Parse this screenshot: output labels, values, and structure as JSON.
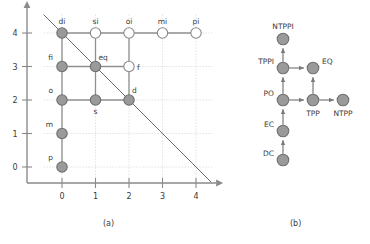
{
  "figure": {
    "captions": {
      "a": "(a)",
      "b": "(b)"
    }
  },
  "chart_data": [
    {
      "type": "scatter",
      "panel": "(a)",
      "title": "",
      "xlabel": "",
      "ylabel": "",
      "xlim": [
        -0.35,
        4.35
      ],
      "ylim": [
        -0.35,
        4.35
      ],
      "xticks": [
        0,
        1,
        2,
        3,
        4
      ],
      "xticklabels": [
        "0",
        "1",
        "2",
        "3",
        "4"
      ],
      "yticks": [
        0,
        1,
        2,
        3,
        4
      ],
      "yticklabels": [
        "0",
        "1",
        "2",
        "3",
        "4"
      ],
      "grid": true,
      "grid_style": "dotted",
      "axis_arrows": true,
      "colors": {
        "filled_node_fill": "#9a9a9a",
        "filled_node_stroke": "#6f6f6f",
        "hollow_node_fill": "#ffffff",
        "hollow_node_stroke": "#8a8a8a",
        "edge": "#8f8f8f",
        "axis": "#8a8a8a",
        "grid": "#c9c9c9",
        "diagonal": "#6e6e6e",
        "label_text": "#3a3a3a",
        "tick_text": "#3a3a3a"
      },
      "points": [
        {
          "label": "p",
          "x": 0,
          "y": 0,
          "filled": true,
          "label_pos": "above-left"
        },
        {
          "label": "m",
          "x": 0,
          "y": 1,
          "filled": true,
          "label_pos": "above-left"
        },
        {
          "label": "o",
          "x": 0,
          "y": 2,
          "filled": true,
          "label_pos": "above-left"
        },
        {
          "label": "s",
          "x": 1,
          "y": 2,
          "filled": true,
          "label_pos": "below"
        },
        {
          "label": "d",
          "x": 2,
          "y": 2,
          "filled": true,
          "label_pos": "above-right"
        },
        {
          "label": "fi",
          "x": 0,
          "y": 3,
          "filled": true,
          "label_pos": "above-left"
        },
        {
          "label": "eq",
          "x": 1,
          "y": 3,
          "filled": true,
          "label_pos": "above-right"
        },
        {
          "label": "f",
          "x": 2,
          "y": 3,
          "filled": false,
          "label_pos": "right"
        },
        {
          "label": "di",
          "x": 0,
          "y": 4,
          "filled": true,
          "label_pos": "above"
        },
        {
          "label": "si",
          "x": 1,
          "y": 4,
          "filled": false,
          "label_pos": "above"
        },
        {
          "label": "oi",
          "x": 2,
          "y": 4,
          "filled": false,
          "label_pos": "above"
        },
        {
          "label": "mi",
          "x": 3,
          "y": 4,
          "filled": false,
          "label_pos": "above"
        },
        {
          "label": "pi",
          "x": 4,
          "y": 4,
          "filled": false,
          "label_pos": "above"
        }
      ],
      "edges": [
        {
          "from": [
            0,
            0
          ],
          "to": [
            0,
            1
          ]
        },
        {
          "from": [
            0,
            1
          ],
          "to": [
            0,
            2
          ]
        },
        {
          "from": [
            0,
            2
          ],
          "to": [
            0,
            3
          ]
        },
        {
          "from": [
            0,
            3
          ],
          "to": [
            0,
            4
          ]
        },
        {
          "from": [
            0,
            2
          ],
          "to": [
            1,
            2
          ]
        },
        {
          "from": [
            1,
            2
          ],
          "to": [
            2,
            2
          ]
        },
        {
          "from": [
            0,
            3
          ],
          "to": [
            1,
            3
          ]
        },
        {
          "from": [
            1,
            3
          ],
          "to": [
            2,
            3
          ]
        },
        {
          "from": [
            0,
            4
          ],
          "to": [
            1,
            4
          ]
        },
        {
          "from": [
            1,
            4
          ],
          "to": [
            2,
            4
          ]
        },
        {
          "from": [
            2,
            4
          ],
          "to": [
            3,
            4
          ]
        },
        {
          "from": [
            3,
            4
          ],
          "to": [
            4,
            4
          ]
        },
        {
          "from": [
            1,
            2
          ],
          "to": [
            1,
            3
          ]
        },
        {
          "from": [
            1,
            3
          ],
          "to": [
            1,
            4
          ]
        },
        {
          "from": [
            2,
            2
          ],
          "to": [
            2,
            3
          ]
        },
        {
          "from": [
            2,
            3
          ],
          "to": [
            2,
            4
          ]
        }
      ],
      "diagonal_line": {
        "from": [
          -0.55,
          4.55
        ],
        "to": [
          4.45,
          -0.45
        ]
      },
      "annotations": []
    },
    {
      "type": "diagram",
      "panel": "(b)",
      "title": "",
      "colors": {
        "node_fill": "#9a9a9a",
        "node_stroke": "#6f6f6f",
        "edge": "#7a7a7a",
        "label_text": "#3a3a3a"
      },
      "nodes": [
        {
          "id": "NTPPI",
          "label": "NTPPI",
          "x": 283,
          "y": 39,
          "label_pos": "above"
        },
        {
          "id": "TPPI",
          "label": "TPPI",
          "x": 283,
          "y": 68,
          "label_pos": "left"
        },
        {
          "id": "EQ",
          "label": "EQ",
          "x": 313,
          "y": 68,
          "label_pos": "right"
        },
        {
          "id": "PO",
          "label": "PO",
          "x": 283,
          "y": 100,
          "label_pos": "left"
        },
        {
          "id": "TPP",
          "label": "TPP",
          "x": 313,
          "y": 100,
          "label_pos": "below"
        },
        {
          "id": "NTPP",
          "label": "NTPP",
          "x": 343,
          "y": 100,
          "label_pos": "below"
        },
        {
          "id": "EC",
          "label": "EC",
          "x": 283,
          "y": 131,
          "label_pos": "left"
        },
        {
          "id": "DC",
          "label": "DC",
          "x": 283,
          "y": 160,
          "label_pos": "left"
        }
      ],
      "edges": [
        {
          "from": "DC",
          "to": "EC",
          "directed": true
        },
        {
          "from": "EC",
          "to": "PO",
          "directed": true
        },
        {
          "from": "PO",
          "to": "TPPI",
          "directed": true
        },
        {
          "from": "TPPI",
          "to": "NTPPI",
          "directed": true
        },
        {
          "from": "TPPI",
          "to": "EQ",
          "directed": true
        },
        {
          "from": "PO",
          "to": "TPP",
          "directed": true
        },
        {
          "from": "TPP",
          "to": "EQ",
          "directed": true
        },
        {
          "from": "TPP",
          "to": "NTPP",
          "directed": true
        }
      ]
    }
  ]
}
